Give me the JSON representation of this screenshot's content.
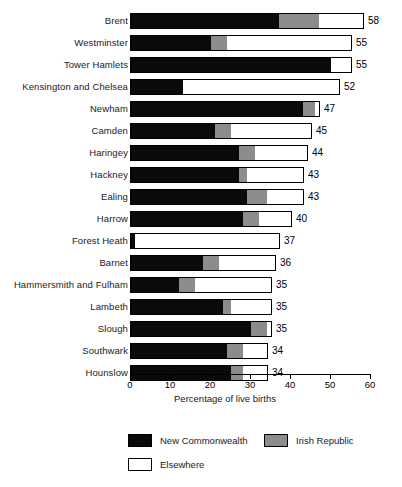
{
  "chart_data": {
    "type": "bar",
    "subtype": "stacked-horizontal",
    "title": "",
    "xlabel": "Percentage of live births",
    "ylabel": "",
    "xlim": [
      0,
      60
    ],
    "xticks": [
      0,
      10,
      20,
      30,
      40,
      50,
      60
    ],
    "grid": false,
    "legend_position": "bottom-left",
    "categories": [
      "Brent",
      "Westminster",
      "Tower Hamlets",
      "Kensington and Chelsea",
      "Newham",
      "Camden",
      "Haringey",
      "Hackney",
      "Ealing",
      "Harrow",
      "Forest Heath",
      "Barnet",
      "Hammersmith and Fulham",
      "Lambeth",
      "Slough",
      "Southwark",
      "Hounslow"
    ],
    "series": [
      {
        "name": "New Commonwealth",
        "color": "#0a0a0a",
        "values": [
          37,
          20,
          50,
          13,
          43,
          21,
          27,
          27,
          29,
          28,
          1,
          18,
          12,
          23,
          30,
          24,
          25
        ]
      },
      {
        "name": "Irish Republic",
        "color": "#8c8c8c",
        "values": [
          10,
          4,
          0,
          0,
          3,
          4,
          4,
          2,
          5,
          4,
          0,
          4,
          4,
          2,
          4,
          4,
          3
        ]
      },
      {
        "name": "Elsewhere",
        "color": "#ffffff",
        "values": [
          11,
          31,
          5,
          39,
          1,
          20,
          13,
          14,
          9,
          8,
          36,
          14,
          19,
          10,
          1,
          6,
          6
        ]
      }
    ],
    "totals": [
      58,
      55,
      55,
      52,
      47,
      45,
      44,
      43,
      43,
      40,
      37,
      36,
      35,
      35,
      35,
      34,
      34
    ],
    "total_labels": [
      "58",
      "55",
      "55",
      "52",
      "47",
      "45",
      "44",
      "43",
      "43",
      "40",
      "37",
      "36",
      "35",
      "35",
      "35",
      "34",
      "34"
    ],
    "tick_labels": [
      "0",
      "10",
      "20",
      "30",
      "40",
      "50",
      "60"
    ]
  },
  "legend": {
    "items": [
      {
        "label": "New Commonwealth",
        "swatch": "black"
      },
      {
        "label": "Irish Republic",
        "swatch": "gray"
      },
      {
        "label": "Elsewhere",
        "swatch": "white"
      }
    ]
  }
}
